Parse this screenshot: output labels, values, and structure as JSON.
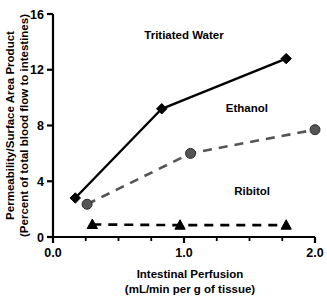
{
  "chart_data": {
    "type": "line",
    "title": "",
    "xlabel": "Intestinal Perfusion",
    "xlabel_units": "(mL/min per g of tissue)",
    "ylabel": "Permeability/Surface Area Product",
    "ylabel_units": "(Percent of total blood flow to intestines)",
    "xlim": [
      0.0,
      2.0
    ],
    "ylim": [
      0,
      16
    ],
    "xticks": [
      0.0,
      1.0,
      2.0
    ],
    "xtick_labels": [
      "0.0",
      "1.0",
      "2.0"
    ],
    "xminor_ticks": [
      0.25,
      0.5,
      0.75,
      1.25,
      1.5,
      1.75
    ],
    "yticks": [
      0,
      4,
      8,
      12,
      16
    ],
    "ytick_labels": [
      "0",
      "4",
      "8",
      "12",
      "16"
    ],
    "grid": false,
    "legend_position": "inline-annotations",
    "series": [
      {
        "name": "Tritiated Water",
        "marker": "diamond",
        "linestyle": "solid",
        "color": "#000000",
        "label_x": 1.0,
        "label_y": 14.2,
        "points": [
          {
            "x": 0.17,
            "y": 2.8
          },
          {
            "x": 0.83,
            "y": 9.2
          },
          {
            "x": 1.78,
            "y": 12.8
          }
        ]
      },
      {
        "name": "Ethanol",
        "marker": "circle",
        "linestyle": "dashed",
        "color": "#555555",
        "label_x": 1.48,
        "label_y": 9.0,
        "points": [
          {
            "x": 0.26,
            "y": 2.35
          },
          {
            "x": 1.05,
            "y": 6.0
          },
          {
            "x": 2.0,
            "y": 7.7
          }
        ]
      },
      {
        "name": "Ribitol",
        "marker": "triangle",
        "linestyle": "dashed",
        "color": "#000000",
        "label_x": 1.52,
        "label_y": 3.0,
        "points": [
          {
            "x": 0.3,
            "y": 0.9
          },
          {
            "x": 0.97,
            "y": 0.85
          },
          {
            "x": 1.78,
            "y": 0.85
          }
        ]
      }
    ]
  }
}
